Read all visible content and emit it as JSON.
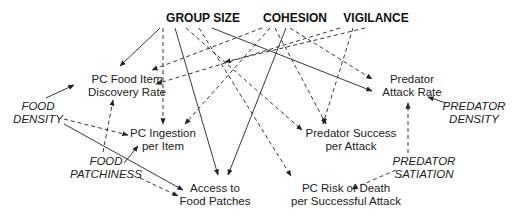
{
  "nodes": {
    "group_size": {
      "lines": [
        "GROUP SIZE"
      ],
      "x": 203,
      "y": 22,
      "kind": "driver"
    },
    "cohesion": {
      "lines": [
        "COHESION"
      ],
      "x": 295,
      "y": 22,
      "kind": "driver"
    },
    "vigilance": {
      "lines": [
        "VIGILANCE"
      ],
      "x": 376,
      "y": 22,
      "kind": "driver"
    },
    "pc_food_discovery": {
      "lines": [
        "PC Food Item",
        "Discovery Rate"
      ],
      "x": 127,
      "y": 83,
      "kind": "outcome"
    },
    "predator_attack_rate": {
      "lines": [
        "Predator",
        "Attack Rate"
      ],
      "x": 412,
      "y": 83,
      "kind": "outcome"
    },
    "food_density": {
      "lines": [
        "FOOD",
        "DENSITY"
      ],
      "x": 38,
      "y": 110,
      "kind": "external"
    },
    "predator_density": {
      "lines": [
        "PREDATOR",
        "DENSITY"
      ],
      "x": 474,
      "y": 110,
      "kind": "external"
    },
    "pc_ingestion": {
      "lines": [
        "PC Ingestion",
        "per Item"
      ],
      "x": 163,
      "y": 137,
      "kind": "outcome"
    },
    "predator_success": {
      "lines": [
        "Predator Success",
        "per Attack"
      ],
      "x": 351,
      "y": 137,
      "kind": "outcome"
    },
    "food_patchiness": {
      "lines": [
        "FOOD",
        "PATCHINESS"
      ],
      "x": 106,
      "y": 165,
      "kind": "external"
    },
    "predator_satiation": {
      "lines": [
        "PREDATOR",
        "SATIATION"
      ],
      "x": 424,
      "y": 165,
      "kind": "external"
    },
    "access_food_patches": {
      "lines": [
        "Access to",
        "Food Patches"
      ],
      "x": 215,
      "y": 192,
      "kind": "outcome"
    },
    "pc_risk_death": {
      "lines": [
        "PC Risk of Death",
        "per Successful Attack"
      ],
      "x": 346,
      "y": 192,
      "kind": "outcome"
    }
  },
  "edges": [
    {
      "from": "group_size",
      "to": "pc_food_discovery",
      "style": "solid",
      "path": [
        [
          160,
          28
        ],
        [
          120,
          66
        ]
      ]
    },
    {
      "from": "group_size",
      "to": "pc_ingestion",
      "style": "dashed",
      "path": [
        [
          163,
          28
        ],
        [
          163,
          124
        ]
      ]
    },
    {
      "from": "group_size",
      "to": "access_food_patches",
      "style": "solid",
      "path": [
        [
          175,
          28
        ],
        [
          218,
          175
        ]
      ]
    },
    {
      "from": "group_size",
      "to": "predator_success",
      "style": "dashed",
      "path": [
        [
          186,
          28
        ],
        [
          302,
          130
        ]
      ]
    },
    {
      "from": "group_size",
      "to": "pc_risk_death",
      "style": "dashed",
      "path": [
        [
          199,
          28
        ],
        [
          291,
          176
        ]
      ]
    },
    {
      "from": "group_size",
      "to": "predator_attack_rate",
      "style": "solid",
      "path": [
        [
          212,
          28
        ],
        [
          372,
          91
        ]
      ]
    },
    {
      "from": "cohesion",
      "to": "pc_food_discovery",
      "style": "dashed",
      "path": [
        [
          262,
          28
        ],
        [
          152,
          70
        ]
      ]
    },
    {
      "from": "cohesion",
      "to": "pc_ingestion",
      "style": "dashed",
      "path": [
        [
          270,
          28
        ],
        [
          185,
          124
        ]
      ]
    },
    {
      "from": "cohesion",
      "to": "access_food_patches",
      "style": "solid",
      "path": [
        [
          286,
          28
        ],
        [
          228,
          175
        ]
      ]
    },
    {
      "from": "cohesion",
      "to": "predator_success",
      "style": "dashed",
      "path": [
        [
          275,
          28
        ],
        [
          326,
          124
        ]
      ]
    },
    {
      "from": "cohesion",
      "to": "predator_attack_rate",
      "style": "dashed",
      "path": [
        [
          290,
          28
        ],
        [
          372,
          79
        ]
      ]
    },
    {
      "from": "vigilance",
      "to": "pc_food_discovery",
      "style": "dashed",
      "path": [
        [
          340,
          28
        ],
        [
          156,
          84
        ]
      ]
    },
    {
      "from": "vigilance",
      "to": "predator_success",
      "style": "dashed",
      "path": [
        [
          353,
          28
        ],
        [
          323,
          124
        ]
      ]
    },
    {
      "from": "vigilance",
      "to": "pc_risk_death",
      "style": "dashed",
      "path": [
        [
          365,
          28
        ],
        [
          225,
          62
        ]
      ]
    },
    {
      "from": "food_density",
      "to": "pc_food_discovery",
      "style": "solid",
      "path": [
        [
          46,
          98
        ],
        [
          74,
          85
        ]
      ]
    },
    {
      "from": "food_density",
      "to": "pc_ingestion",
      "style": "dashed",
      "path": [
        [
          64,
          119
        ],
        [
          128,
          135
        ]
      ]
    },
    {
      "from": "food_density",
      "to": "access_food_patches",
      "style": "solid",
      "path": [
        [
          64,
          124
        ],
        [
          183,
          190
        ]
      ]
    },
    {
      "from": "food_patchiness",
      "to": "pc_food_discovery",
      "style": "dashed",
      "path": [
        [
          103,
          152
        ],
        [
          113,
          100
        ]
      ]
    },
    {
      "from": "food_patchiness",
      "to": "pc_ingestion",
      "style": "solid",
      "path": [
        [
          124,
          163
        ],
        [
          138,
          146
        ]
      ]
    },
    {
      "from": "food_patchiness",
      "to": "access_food_patches",
      "style": "dashed",
      "path": [
        [
          140,
          178
        ],
        [
          178,
          196
        ]
      ]
    },
    {
      "from": "predator_density",
      "to": "predator_attack_rate",
      "style": "solid",
      "path": [
        [
          446,
          103
        ],
        [
          428,
          97
        ]
      ]
    },
    {
      "from": "predator_satiation",
      "to": "predator_attack_rate",
      "style": "dashed",
      "path": [
        [
          408,
          153
        ],
        [
          408,
          103
        ]
      ]
    },
    {
      "from": "predator_satiation",
      "to": "pc_risk_death",
      "style": "dashed",
      "path": [
        [
          396,
          170
        ],
        [
          352,
          189
        ]
      ]
    }
  ]
}
